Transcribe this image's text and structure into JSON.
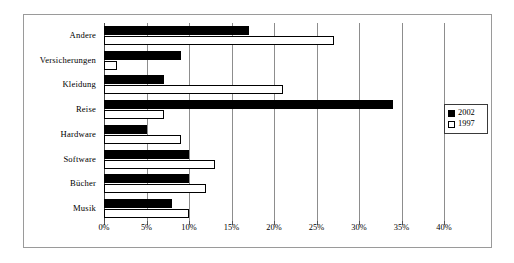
{
  "chart_data": {
    "type": "bar",
    "orientation": "horizontal",
    "title": "",
    "subtitle": "",
    "xlabel": "",
    "ylabel": "",
    "xlim": [
      0,
      40
    ],
    "xunit": "%",
    "grid": true,
    "legend_position": "right",
    "categories": [
      "Andere",
      "Versicherungen",
      "Kleidung",
      "Reise",
      "Hardware",
      "Software",
      "Bücher",
      "Musik"
    ],
    "xticks": [
      0,
      5,
      10,
      15,
      20,
      25,
      30,
      35,
      40
    ],
    "xticklabels": [
      "0%",
      "5%",
      "10%",
      "15%",
      "20%",
      "25%",
      "30%",
      "35%",
      "40%"
    ],
    "series": [
      {
        "name": "2002",
        "color": "#000000",
        "style": "filled",
        "values": [
          17,
          9,
          7,
          34,
          5,
          10,
          10,
          8
        ]
      },
      {
        "name": "1997",
        "color": "#ffffff",
        "style": "hollow",
        "values": [
          27,
          1.5,
          21,
          7,
          9,
          13,
          12,
          10
        ]
      }
    ]
  },
  "legend": {
    "entries": [
      {
        "label": "2002",
        "swatch": "filled-square"
      },
      {
        "label": "1997",
        "swatch": "hollow-square"
      }
    ]
  }
}
